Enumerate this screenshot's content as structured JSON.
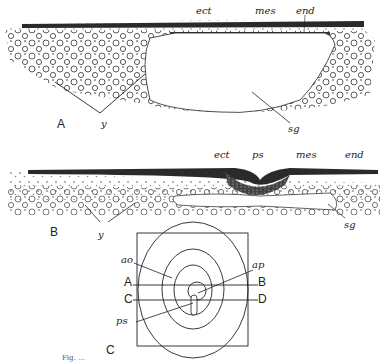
{
  "figure": {
    "panel_A": {
      "label": "A",
      "annotations": {
        "ect": "ect",
        "mes": "mes",
        "end": "end",
        "y": "y",
        "sg": "sg"
      }
    },
    "panel_B": {
      "label": "B",
      "annotations": {
        "ect": "ect",
        "ps": "ps",
        "mes": "mes",
        "end": "end",
        "y": "y",
        "sg": "sg"
      }
    },
    "panel_C": {
      "label": "C",
      "annotations": {
        "ao": "ao",
        "ap": "ap",
        "ps": "ps",
        "A": "A",
        "B": "B",
        "C": "C",
        "D": "D"
      }
    },
    "caption_partial": "Fig. ..."
  }
}
